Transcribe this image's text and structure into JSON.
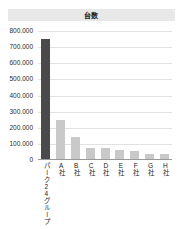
{
  "chart_data": {
    "type": "bar",
    "title": "台数",
    "xlabel": "",
    "ylabel": "",
    "categories": [
      "パーク24グループ",
      "A社",
      "B社",
      "C社",
      "D社",
      "E社",
      "F社",
      "G社",
      "H社"
    ],
    "values": [
      750000,
      245000,
      135000,
      68000,
      66000,
      58000,
      47000,
      33000,
      32000
    ],
    "ylim": [
      0,
      800000
    ],
    "ytick_labels": [
      "800.000",
      "700.000",
      "600.000",
      "500.000",
      "400.000",
      "300.000",
      "200.000",
      "100.000",
      "0"
    ],
    "ytick_values": [
      800000,
      700000,
      600000,
      500000,
      400000,
      300000,
      200000,
      100000,
      0
    ],
    "grid": true,
    "legend": "none",
    "highlight_index": 0,
    "colors": {
      "highlight_bar": "#4a4a4a",
      "bar": "#c9c9c9",
      "gridline": "#e2e2e2",
      "title_bar_bg": "#e8e8e8",
      "text": "#1a1a1a",
      "background": "#ffffff"
    }
  }
}
